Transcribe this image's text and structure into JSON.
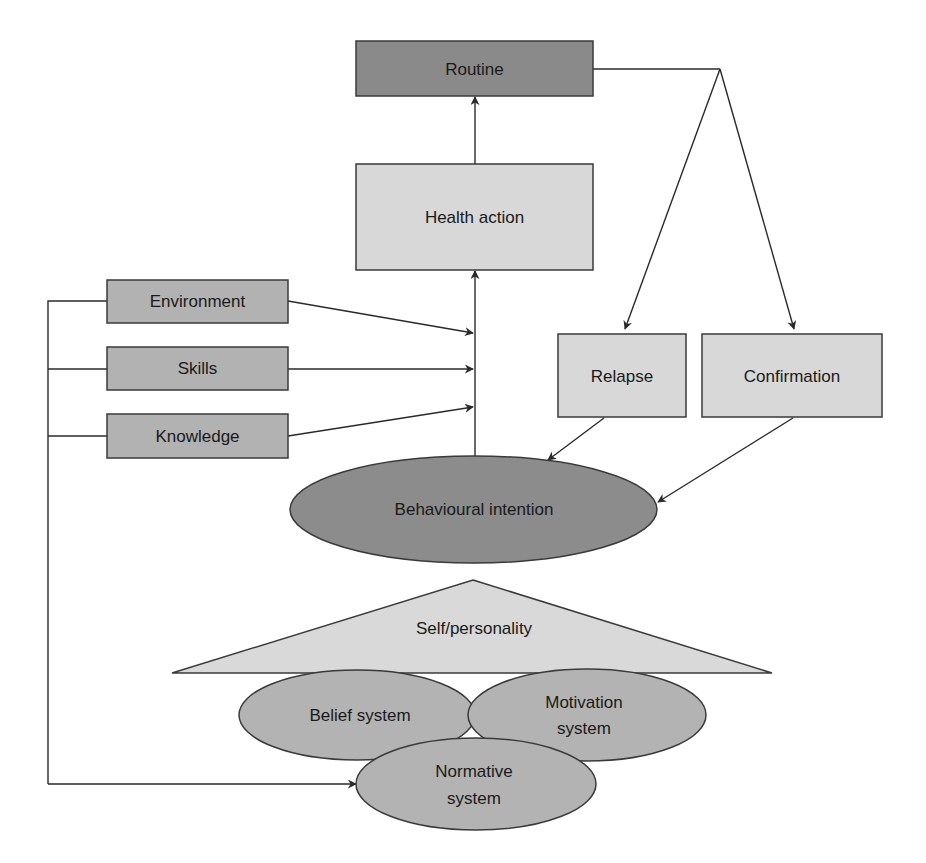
{
  "diagram": {
    "colors": {
      "dark_fill": "#8a8a8a",
      "medium_fill": "#b2b2b2",
      "light_fill": "#d8d8d8",
      "stroke": "#3a3a3a",
      "edge": "#2a2a2a",
      "background": "#ffffff"
    },
    "nodes": {
      "routine": {
        "label": "Routine",
        "shape": "rectangle",
        "fill": "dark"
      },
      "health_action": {
        "label": "Health action",
        "shape": "rectangle",
        "fill": "light"
      },
      "environment": {
        "label": "Environment",
        "shape": "rectangle",
        "fill": "medium"
      },
      "skills": {
        "label": "Skills",
        "shape": "rectangle",
        "fill": "medium"
      },
      "knowledge": {
        "label": "Knowledge",
        "shape": "rectangle",
        "fill": "medium"
      },
      "relapse": {
        "label": "Relapse",
        "shape": "rectangle",
        "fill": "light"
      },
      "confirmation": {
        "label": "Confirmation",
        "shape": "rectangle",
        "fill": "light"
      },
      "behavioural_intention": {
        "label": "Behavioural intention",
        "shape": "ellipse",
        "fill": "dark"
      },
      "self_personality": {
        "label": "Self/personality",
        "shape": "triangle",
        "fill": "light"
      },
      "belief_system": {
        "label": "Belief system",
        "shape": "ellipse",
        "fill": "medium"
      },
      "motivation_system": {
        "label_line1": "Motivation",
        "label_line2": "system",
        "shape": "ellipse",
        "fill": "medium"
      },
      "normative_system": {
        "label_line1": "Normative",
        "label_line2": "system",
        "shape": "ellipse",
        "fill": "medium"
      }
    },
    "edges": [
      {
        "from": "health_action",
        "to": "routine"
      },
      {
        "from": "behavioural_intention",
        "to": "health_action"
      },
      {
        "from": "environment",
        "to": "intention-action-link"
      },
      {
        "from": "skills",
        "to": "intention-action-link"
      },
      {
        "from": "knowledge",
        "to": "intention-action-link"
      },
      {
        "from": "routine",
        "to": "relapse"
      },
      {
        "from": "routine",
        "to": "confirmation"
      },
      {
        "from": "relapse",
        "to": "behavioural_intention"
      },
      {
        "from": "confirmation",
        "to": "behavioural_intention"
      },
      {
        "from": "environment",
        "to": "normative_system",
        "via": "left-bracket"
      },
      {
        "from": "skills",
        "to": "normative_system",
        "via": "left-bracket"
      },
      {
        "from": "knowledge",
        "to": "normative_system",
        "via": "left-bracket"
      }
    ]
  }
}
